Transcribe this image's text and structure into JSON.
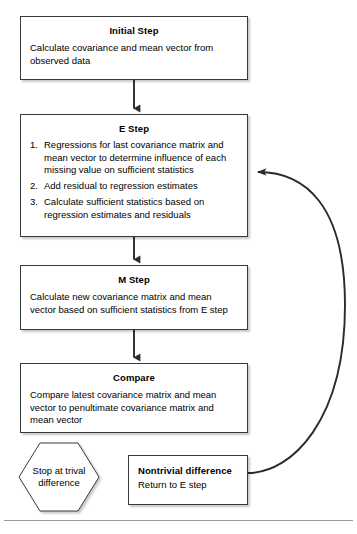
{
  "diagram": {
    "type": "flowchart",
    "colors": {
      "background": "#ffffff",
      "node_border": "#3a3a3a",
      "node_fill": "#ffffff",
      "connector": "#2b2b2b",
      "rule": "#9a9a9a",
      "text": "#000000"
    },
    "nodes": [
      {
        "id": "initial",
        "shape": "rectangle",
        "title": "Initial Step",
        "body": "Calculate covariance and mean vector from observed data"
      },
      {
        "id": "estep",
        "shape": "rectangle",
        "title": "E Step",
        "steps": [
          "Regressions for last covariance matrix and mean vector to determine influence of each missing value on sufficient statistics",
          "Add residual to regression estimates",
          "Calculate sufficient statistics based on regression estimates and residuals"
        ]
      },
      {
        "id": "mstep",
        "shape": "rectangle",
        "title": "M Step",
        "body": "Calculate new covariance matrix and mean vector based on sufficient statistics from E step"
      },
      {
        "id": "compare",
        "shape": "rectangle",
        "title": "Compare",
        "body": "Compare latest covariance matrix and mean vector to penultimate covariance matrix and mean vector"
      },
      {
        "id": "stop",
        "shape": "hexagon",
        "label": "Stop at trival difference"
      },
      {
        "id": "nontrivial",
        "shape": "rectangle",
        "title": "Nontrivial difference",
        "body": "Return to E step"
      }
    ],
    "connectors": [
      {
        "id": "initial-to-estep",
        "from": "initial",
        "to": "estep",
        "style": "straight-arrow-down"
      },
      {
        "id": "estep-to-mstep",
        "from": "estep",
        "to": "mstep",
        "style": "straight-arrow-down"
      },
      {
        "id": "mstep-to-compare",
        "from": "mstep",
        "to": "compare",
        "style": "straight-arrow-down"
      },
      {
        "id": "nontrivial-to-estep",
        "from": "nontrivial",
        "to": "estep",
        "style": "curved-feedback-arrow"
      }
    ]
  }
}
